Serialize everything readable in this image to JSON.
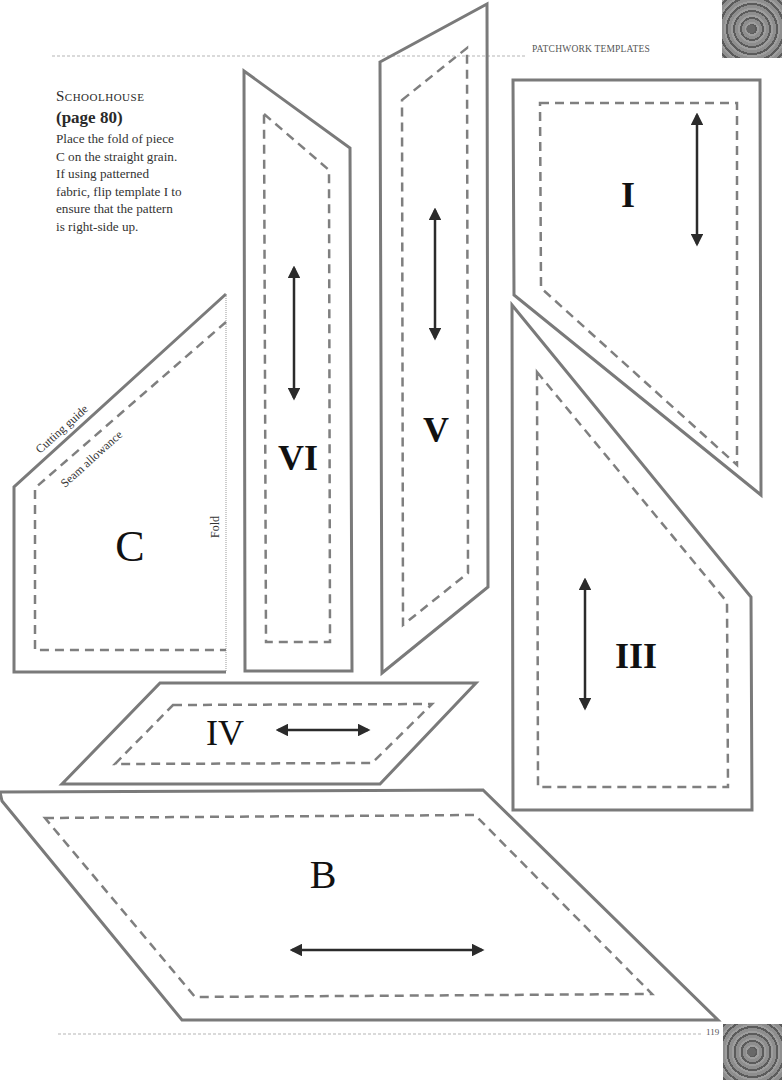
{
  "header": {
    "section_label": "PATCHWORK TEMPLATES"
  },
  "intro": {
    "title": "Schoolhouse",
    "page_ref": "(page 80)",
    "body": "Place the fold of piece\nC on the straight grain.\nIf using patterned\nfabric, flip template I to\nensure that the pattern\nis right-side up."
  },
  "annotations": {
    "cutting_guide": "Cutting guide",
    "seam_allowance": "Seam allowance",
    "fold": "Fold"
  },
  "pieces": {
    "C": {
      "label": "C"
    },
    "VI": {
      "label": "VI"
    },
    "V": {
      "label": "V"
    },
    "I": {
      "label": "I"
    },
    "III": {
      "label": "III"
    },
    "IV": {
      "label": "IV"
    },
    "B": {
      "label": "B"
    }
  },
  "footer": {
    "page_number": "119"
  },
  "colors": {
    "cut_line": "#7a7a7a",
    "seam_line": "#7f7f7f",
    "grain_arrow": "#2b2b2b",
    "rule_line": "#b5b5b5"
  }
}
